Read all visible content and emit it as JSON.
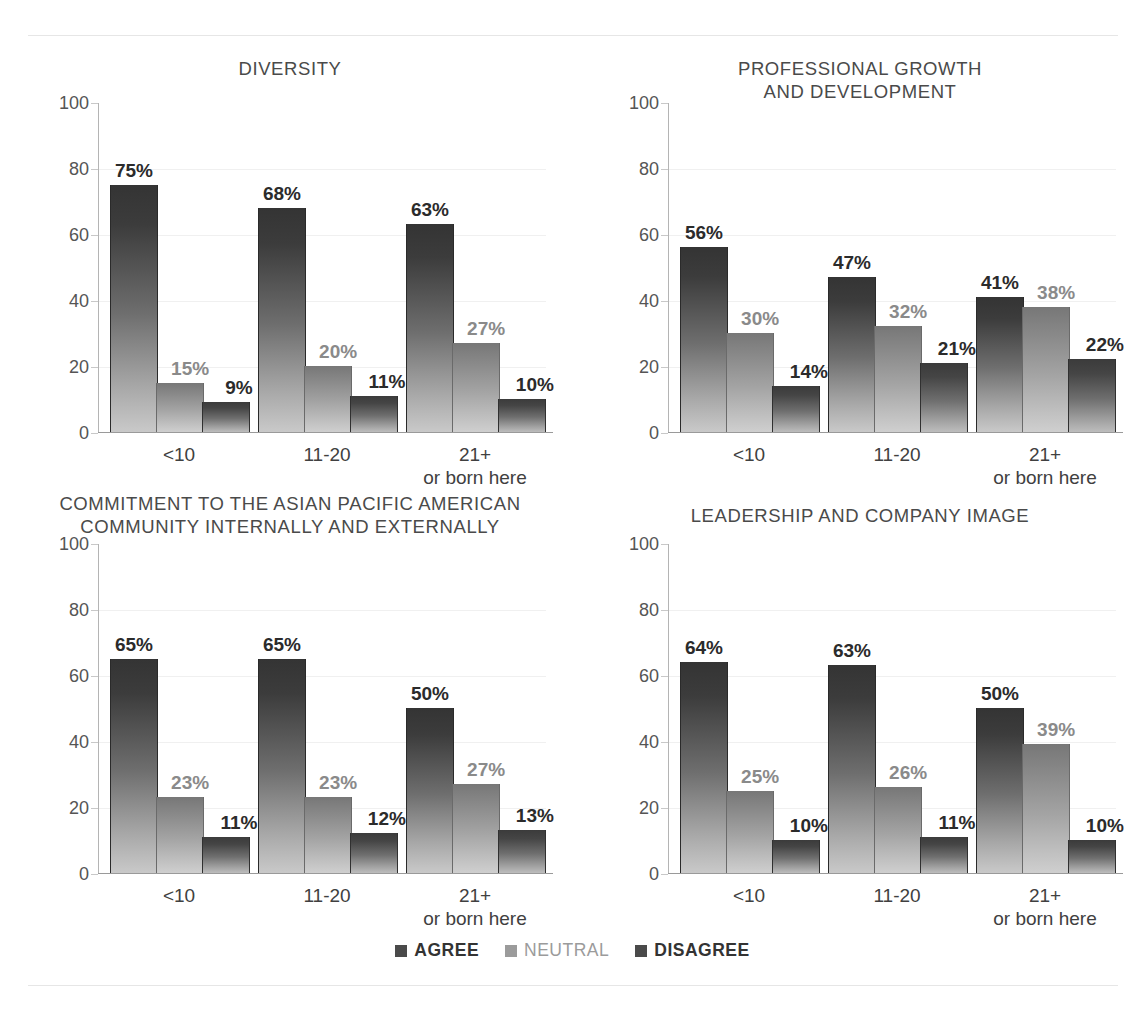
{
  "legend": {
    "items": [
      {
        "label": "AGREE",
        "color": "#4a4a4a"
      },
      {
        "label": "NEUTRAL",
        "color": "#9b9b9b"
      },
      {
        "label": "DISAGREE",
        "color": "#4a4a4a"
      }
    ]
  },
  "axis": {
    "yticks": [
      "100",
      "80",
      "60",
      "40",
      "20",
      "0"
    ],
    "xlabels": [
      "<10",
      "11-20",
      "21+\nor born here"
    ]
  },
  "chart_data": [
    {
      "type": "bar",
      "title": "DIVERSITY",
      "xlabel": "",
      "ylabel": "",
      "ylim": [
        0,
        100
      ],
      "grid": true,
      "legend_position": "bottom",
      "categories": [
        "<10",
        "11-20",
        "21+ or born here"
      ],
      "series": [
        {
          "name": "AGREE",
          "values": [
            75,
            68,
            63
          ],
          "labels": [
            "75%",
            "68%",
            "63%"
          ]
        },
        {
          "name": "NEUTRAL",
          "values": [
            15,
            20,
            27
          ],
          "labels": [
            "15%",
            "20%",
            "27%"
          ]
        },
        {
          "name": "DISAGREE",
          "values": [
            9,
            11,
            10
          ],
          "labels": [
            "9%",
            "11%",
            "10%"
          ]
        }
      ]
    },
    {
      "type": "bar",
      "title": "PROFESSIONAL GROWTH\nAND DEVELOPMENT",
      "xlabel": "",
      "ylabel": "",
      "ylim": [
        0,
        100
      ],
      "grid": true,
      "legend_position": "bottom",
      "categories": [
        "<10",
        "11-20",
        "21+ or born here"
      ],
      "series": [
        {
          "name": "AGREE",
          "values": [
            56,
            47,
            41
          ],
          "labels": [
            "56%",
            "47%",
            "41%"
          ]
        },
        {
          "name": "NEUTRAL",
          "values": [
            30,
            32,
            38
          ],
          "labels": [
            "30%",
            "32%",
            "38%"
          ]
        },
        {
          "name": "DISAGREE",
          "values": [
            14,
            21,
            22
          ],
          "labels": [
            "14%",
            "21%",
            "22%"
          ]
        }
      ]
    },
    {
      "type": "bar",
      "title": "COMMITMENT TO THE ASIAN PACIFIC AMERICAN\nCOMMUNITY INTERNALLY AND EXTERNALLY",
      "xlabel": "",
      "ylabel": "",
      "ylim": [
        0,
        100
      ],
      "grid": true,
      "legend_position": "bottom",
      "categories": [
        "<10",
        "11-20",
        "21+ or born here"
      ],
      "series": [
        {
          "name": "AGREE",
          "values": [
            65,
            65,
            50
          ],
          "labels": [
            "65%",
            "65%",
            "50%"
          ]
        },
        {
          "name": "NEUTRAL",
          "values": [
            23,
            23,
            27
          ],
          "labels": [
            "23%",
            "23%",
            "27%"
          ]
        },
        {
          "name": "DISAGREE",
          "values": [
            11,
            12,
            13
          ],
          "labels": [
            "11%",
            "12%",
            "13%"
          ]
        }
      ]
    },
    {
      "type": "bar",
      "title": "LEADERSHIP AND COMPANY IMAGE",
      "xlabel": "",
      "ylabel": "",
      "ylim": [
        0,
        100
      ],
      "grid": true,
      "legend_position": "bottom",
      "categories": [
        "<10",
        "11-20",
        "21+ or born here"
      ],
      "series": [
        {
          "name": "AGREE",
          "values": [
            64,
            63,
            50
          ],
          "labels": [
            "64%",
            "63%",
            "50%"
          ]
        },
        {
          "name": "NEUTRAL",
          "values": [
            25,
            26,
            39
          ],
          "labels": [
            "25%",
            "26%",
            "39%"
          ]
        },
        {
          "name": "DISAGREE",
          "values": [
            10,
            11,
            10
          ],
          "labels": [
            "10%",
            "11%",
            "10%"
          ]
        }
      ]
    }
  ]
}
